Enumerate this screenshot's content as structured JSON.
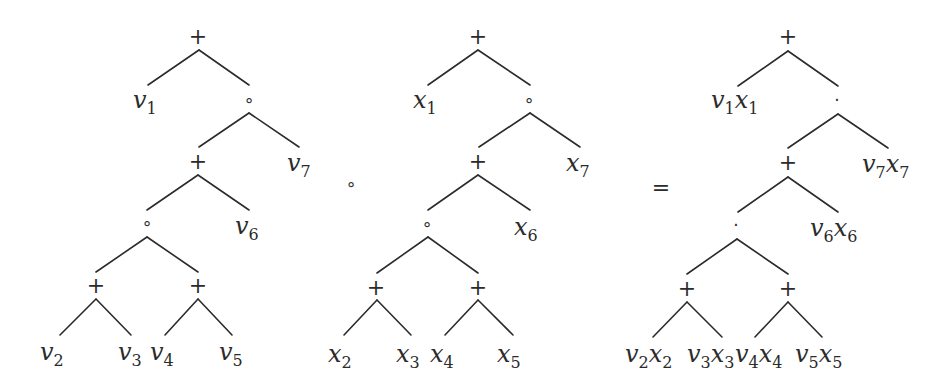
{
  "diagram": {
    "title": "",
    "between_operators": [
      {
        "id": "compose-operator",
        "symbol": "∘",
        "x": 351,
        "y": 190,
        "kind": "small"
      },
      {
        "id": "equals-operator",
        "symbol": "=",
        "x": 661,
        "y": 195,
        "kind": "big"
      }
    ],
    "trees": [
      {
        "id": "left-tree",
        "variable": "v",
        "nodes": [
          {
            "id": "n0",
            "type": "op",
            "symbol": "+",
            "x": 198,
            "y": 44
          },
          {
            "id": "n1",
            "type": "leaf",
            "base": "v",
            "sub": "1",
            "x": 133,
            "y": 108
          },
          {
            "id": "n2",
            "type": "op",
            "symbol": "∘",
            "x": 249,
            "y": 106
          },
          {
            "id": "n3",
            "type": "op",
            "symbol": "+",
            "x": 198,
            "y": 169
          },
          {
            "id": "n4",
            "type": "leaf",
            "base": "v",
            "sub": "7",
            "x": 287,
            "y": 171
          },
          {
            "id": "n5",
            "type": "op",
            "symbol": "∘",
            "x": 147,
            "y": 229
          },
          {
            "id": "n6",
            "type": "leaf",
            "base": "v",
            "sub": "6",
            "x": 235,
            "y": 234
          },
          {
            "id": "n7",
            "type": "op",
            "symbol": "+",
            "x": 96,
            "y": 293
          },
          {
            "id": "n8",
            "type": "op",
            "symbol": "+",
            "x": 198,
            "y": 293
          },
          {
            "id": "n9",
            "type": "leaf",
            "base": "v",
            "sub": "2",
            "x": 40,
            "y": 360
          },
          {
            "id": "n10",
            "type": "leaf",
            "base": "v",
            "sub": "3",
            "x": 118,
            "y": 360
          },
          {
            "id": "n11",
            "type": "leaf",
            "base": "v",
            "sub": "4",
            "x": 150,
            "y": 360
          },
          {
            "id": "n12",
            "type": "leaf",
            "base": "v",
            "sub": "5",
            "x": 219,
            "y": 360
          }
        ],
        "edges": [
          [
            199,
            50,
            148,
            85
          ],
          [
            199,
            50,
            249,
            85
          ],
          [
            249,
            113,
            199,
            147
          ],
          [
            249,
            113,
            299,
            147
          ],
          [
            198,
            175,
            147,
            210
          ],
          [
            198,
            175,
            249,
            210
          ],
          [
            147,
            237,
            96,
            272
          ],
          [
            147,
            237,
            198,
            272
          ],
          [
            96,
            299,
            60,
            335
          ],
          [
            96,
            299,
            131,
            335
          ],
          [
            198,
            299,
            165,
            335
          ],
          [
            198,
            299,
            232,
            335
          ]
        ]
      },
      {
        "id": "middle-tree",
        "variable": "x",
        "nodes": [
          {
            "id": "m0",
            "type": "op",
            "symbol": "+",
            "x": 478,
            "y": 44
          },
          {
            "id": "m1",
            "type": "leaf",
            "base": "x",
            "sub": "1",
            "x": 413,
            "y": 108
          },
          {
            "id": "m2",
            "type": "op",
            "symbol": "∘",
            "x": 529,
            "y": 106
          },
          {
            "id": "m3",
            "type": "op",
            "symbol": "+",
            "x": 478,
            "y": 169
          },
          {
            "id": "m4",
            "type": "leaf",
            "base": "x",
            "sub": "7",
            "x": 566,
            "y": 171
          },
          {
            "id": "m5",
            "type": "op",
            "symbol": "∘",
            "x": 427,
            "y": 230
          },
          {
            "id": "m6",
            "type": "leaf",
            "base": "x",
            "sub": "6",
            "x": 514,
            "y": 235
          },
          {
            "id": "m7",
            "type": "op",
            "symbol": "+",
            "x": 376,
            "y": 295
          },
          {
            "id": "m8",
            "type": "op",
            "symbol": "+",
            "x": 478,
            "y": 295
          },
          {
            "id": "m9",
            "type": "leaf",
            "base": "x",
            "sub": "2",
            "x": 328,
            "y": 362
          },
          {
            "id": "m10",
            "type": "leaf",
            "base": "x",
            "sub": "3",
            "x": 396,
            "y": 362
          },
          {
            "id": "m11",
            "type": "leaf",
            "base": "x",
            "sub": "4",
            "x": 430,
            "y": 362
          },
          {
            "id": "m12",
            "type": "leaf",
            "base": "x",
            "sub": "5",
            "x": 497,
            "y": 362
          }
        ],
        "edges": [
          [
            478,
            50,
            428,
            85
          ],
          [
            478,
            50,
            530,
            85
          ],
          [
            530,
            113,
            479,
            147
          ],
          [
            530,
            113,
            580,
            147
          ],
          [
            478,
            175,
            428,
            210
          ],
          [
            478,
            175,
            530,
            210
          ],
          [
            428,
            237,
            377,
            273
          ],
          [
            428,
            237,
            478,
            273
          ],
          [
            377,
            300,
            344,
            335
          ],
          [
            377,
            300,
            411,
            335
          ],
          [
            478,
            300,
            445,
            335
          ],
          [
            478,
            300,
            513,
            335
          ]
        ]
      },
      {
        "id": "right-tree",
        "variable": "vx",
        "nodes": [
          {
            "id": "r0",
            "type": "op",
            "symbol": "+",
            "x": 788,
            "y": 44
          },
          {
            "id": "r1",
            "type": "pair",
            "a": "v",
            "asub": "1",
            "b": "x",
            "bsub": "1",
            "x": 711,
            "y": 108
          },
          {
            "id": "r2",
            "type": "op",
            "symbol": "·",
            "x": 837,
            "y": 106
          },
          {
            "id": "r3",
            "type": "op",
            "symbol": "+",
            "x": 788,
            "y": 170
          },
          {
            "id": "r4",
            "type": "pair",
            "a": "v",
            "asub": "7",
            "b": "x",
            "bsub": "7",
            "x": 862,
            "y": 172
          },
          {
            "id": "r5",
            "type": "op",
            "symbol": "·",
            "x": 736,
            "y": 231
          },
          {
            "id": "r6",
            "type": "pair",
            "a": "v",
            "asub": "6",
            "b": "x",
            "bsub": "6",
            "x": 810,
            "y": 236
          },
          {
            "id": "r7",
            "type": "op",
            "symbol": "+",
            "x": 687,
            "y": 296
          },
          {
            "id": "r8",
            "type": "op",
            "symbol": "+",
            "x": 788,
            "y": 296
          },
          {
            "id": "r9",
            "type": "pair",
            "a": "v",
            "asub": "2",
            "b": "x",
            "bsub": "2",
            "x": 625,
            "y": 362
          },
          {
            "id": "r10",
            "type": "pair",
            "a": "v",
            "asub": "3",
            "b": "x",
            "bsub": "3",
            "x": 687,
            "y": 362
          },
          {
            "id": "r11",
            "type": "pair",
            "a": "v",
            "asub": "4",
            "b": "x",
            "bsub": "4",
            "x": 735,
            "y": 362
          },
          {
            "id": "r12",
            "type": "pair",
            "a": "v",
            "asub": "5",
            "b": "x",
            "bsub": "5",
            "x": 795,
            "y": 362
          }
        ],
        "edges": [
          [
            788,
            51,
            738,
            86
          ],
          [
            788,
            51,
            838,
            86
          ],
          [
            838,
            114,
            788,
            148
          ],
          [
            838,
            114,
            888,
            148
          ],
          [
            788,
            177,
            738,
            212
          ],
          [
            788,
            177,
            838,
            212
          ],
          [
            737,
            239,
            687,
            274
          ],
          [
            737,
            239,
            788,
            274
          ],
          [
            687,
            302,
            653,
            337
          ],
          [
            687,
            302,
            722,
            337
          ],
          [
            788,
            302,
            755,
            337
          ],
          [
            788,
            302,
            822,
            337
          ]
        ]
      }
    ]
  }
}
